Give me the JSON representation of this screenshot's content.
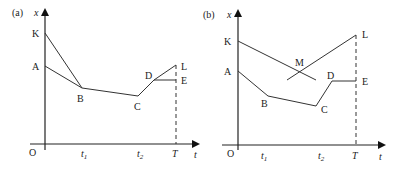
{
  "panels": [
    {
      "id": "a",
      "tag": "(a)",
      "y_axis_label": "x",
      "x_axis_label": "t",
      "origin_label": "O",
      "ticks": [
        {
          "label": "t",
          "sub": "1"
        },
        {
          "label": "t",
          "sub": "2"
        },
        {
          "label": "T",
          "sub": ""
        }
      ],
      "points": {
        "K": "K",
        "A": "A",
        "B": "B",
        "C": "C",
        "D": "D",
        "L": "L",
        "E": "E"
      }
    },
    {
      "id": "b",
      "tag": "(b)",
      "y_axis_label": "x",
      "x_axis_label": "t",
      "origin_label": "O",
      "ticks": [
        {
          "label": "t",
          "sub": "1"
        },
        {
          "label": "t",
          "sub": "2"
        },
        {
          "label": "T",
          "sub": ""
        }
      ],
      "points": {
        "K": "K",
        "A": "A",
        "B": "B",
        "C": "C",
        "D": "D",
        "L": "L",
        "E": "E",
        "M": "M"
      }
    }
  ]
}
